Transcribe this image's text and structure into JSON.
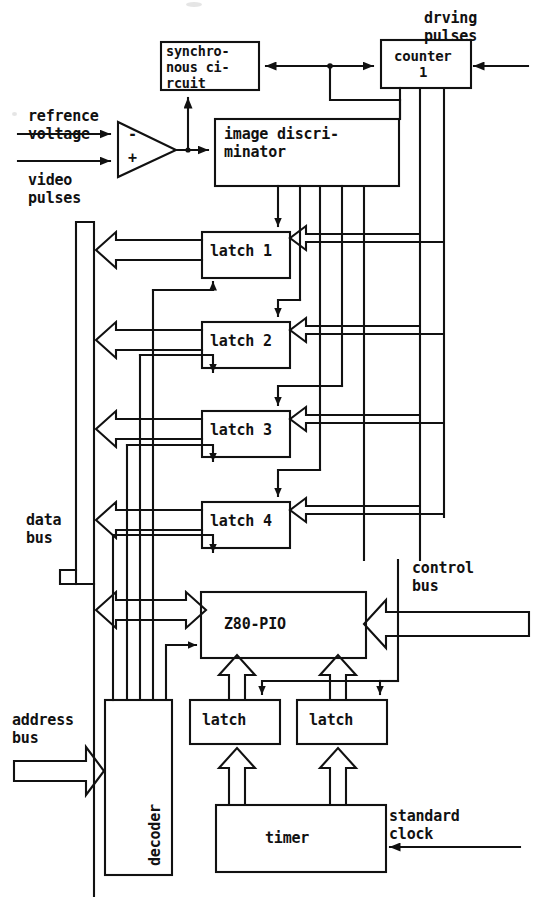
{
  "diagram": {
    "ink_color": "#111111",
    "paper_color": "#ffffff"
  },
  "blocks": {
    "sync_circuit": {
      "line1": "synchro-",
      "line2": "nous ci-",
      "line3": "rcuit"
    },
    "counter": {
      "line1": "counter",
      "line2": "1"
    },
    "image_discriminator": {
      "line1": "image discri-",
      "line2": "minator"
    },
    "latch1": {
      "label": "latch 1"
    },
    "latch2": {
      "label": "latch 2"
    },
    "latch3": {
      "label": "latch 3"
    },
    "latch4": {
      "label": "latch 4"
    },
    "pio": {
      "label": "Z80-PIO"
    },
    "decoder": {
      "label": "decoder"
    },
    "latch_a": {
      "label": "latch"
    },
    "latch_b": {
      "label": "latch"
    },
    "timer": {
      "label": "timer"
    }
  },
  "io_labels": {
    "refrence_voltage": {
      "line1": "refrence",
      "line2": "voltage"
    },
    "video_pulses": {
      "line1": "video",
      "line2": "pulses"
    },
    "drving_pulses": {
      "line1": "drving",
      "line2": "pulses"
    },
    "data_bus": {
      "line1": "data",
      "line2": "bus"
    },
    "control_bus": {
      "line1": "control",
      "line2": "bus"
    },
    "address_bus": {
      "line1": "address",
      "line2": "bus"
    },
    "standard_clock": {
      "line1": "standard",
      "line2": "clock"
    }
  },
  "comparator": {
    "minus_sign": "-",
    "plus_sign": "+"
  }
}
